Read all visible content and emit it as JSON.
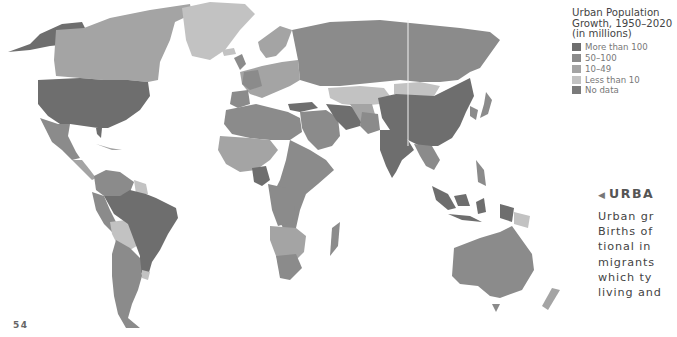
{
  "legend": {
    "title_lines": [
      "Urban Population",
      "Growth, 1950–2020",
      "(in millions)"
    ],
    "items": [
      {
        "label": "More than 100",
        "color": "#6e6e6e"
      },
      {
        "label": "50–100",
        "color": "#8b8b8b"
      },
      {
        "label": "10–49",
        "color": "#a4a4a4"
      },
      {
        "label": "Less than 10",
        "color": "#c2c2c2"
      },
      {
        "label": "No data",
        "color": "#7a7a7a"
      }
    ]
  },
  "sidebar": {
    "arrow_icon": "◀",
    "heading": "URBA",
    "lines": [
      "Urban gr",
      "Births of",
      "tional in",
      "migrants",
      "which ty",
      "living and"
    ]
  },
  "page_number": "54",
  "map": {
    "regions": [
      {
        "name": "Alaska/USA",
        "category": "More than 100"
      },
      {
        "name": "Canada",
        "category": "10–49"
      },
      {
        "name": "Greenland",
        "category": "Less than 10"
      },
      {
        "name": "USA",
        "category": "More than 100"
      },
      {
        "name": "Mexico",
        "category": "50–100"
      },
      {
        "name": "Brazil",
        "category": "More than 100"
      },
      {
        "name": "Argentina",
        "category": "10–49"
      },
      {
        "name": "Russia",
        "category": "50–100"
      },
      {
        "name": "China",
        "category": "More than 100"
      },
      {
        "name": "India",
        "category": "More than 100"
      },
      {
        "name": "Nigeria",
        "category": "More than 100"
      },
      {
        "name": "Indonesia",
        "category": "More than 100"
      },
      {
        "name": "Australia",
        "category": "10–49"
      },
      {
        "name": "Kazakhstan",
        "category": "Less than 10"
      },
      {
        "name": "Mongolia",
        "category": "Less than 10"
      }
    ]
  }
}
